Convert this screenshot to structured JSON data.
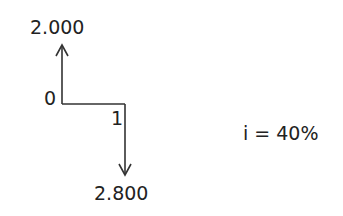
{
  "diagram": {
    "type": "cash-flow-diagram",
    "periods": [
      {
        "label": "0",
        "cash_flow": {
          "value": "2.000",
          "direction": "up"
        }
      },
      {
        "label": "1",
        "cash_flow": {
          "value": "2.800",
          "direction": "down"
        }
      }
    ],
    "interest_rate": "i = 40%",
    "colors": {
      "line": "#333333",
      "text": "#222222"
    }
  }
}
